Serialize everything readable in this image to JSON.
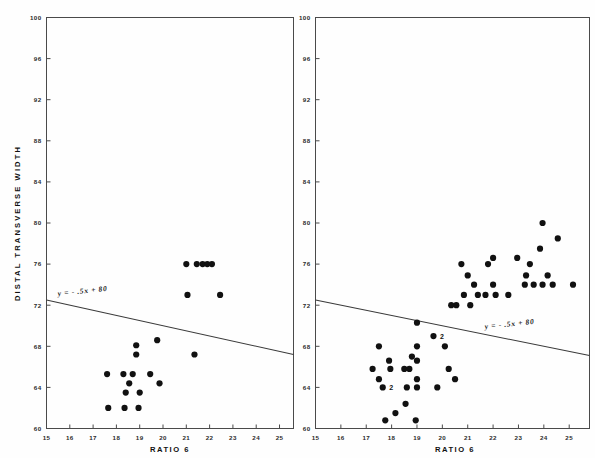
{
  "figure": {
    "type": "scatter-figure",
    "panel_count": 2
  },
  "axes": {
    "x_title": "RATIO 6",
    "y_title": "DISTAL  TRANSVERSE  WIDTH",
    "x_ticks": [
      "15",
      "16",
      "17",
      "18",
      "19",
      "20",
      "21",
      "22",
      "23",
      "24",
      "25"
    ],
    "y_ticks": [
      "60",
      "64",
      "68",
      "72",
      "76",
      "80",
      "84",
      "88",
      "92",
      "96",
      "100"
    ],
    "equation": "y = - .5x + 80"
  },
  "annotations": {
    "overplot_two": "2"
  },
  "chart_data": [
    {
      "type": "scatter",
      "title": "",
      "panel": "left",
      "xlabel": "RATIO 6",
      "ylabel": "DISTAL TRANSVERSE WIDTH",
      "xlim": [
        15,
        25.6
      ],
      "ylim": [
        60,
        100
      ],
      "xticks": [
        15,
        16,
        17,
        18,
        19,
        20,
        21,
        22,
        23,
        24,
        25
      ],
      "yticks": [
        60,
        64,
        68,
        72,
        76,
        80,
        84,
        88,
        92,
        96,
        100
      ],
      "grid": false,
      "legend": false,
      "regression_line": {
        "label": "y = - .5x + 80",
        "slope": -0.5,
        "intercept": 80,
        "x_start": 15,
        "y_start": 72.5,
        "x_end": 25.6,
        "y_end": 67.2
      },
      "points": [
        {
          "x": 17.65,
          "y": 62.0
        },
        {
          "x": 18.35,
          "y": 62.0
        },
        {
          "x": 18.95,
          "y": 62.0
        },
        {
          "x": 17.6,
          "y": 65.3
        },
        {
          "x": 18.3,
          "y": 65.3
        },
        {
          "x": 18.7,
          "y": 65.3
        },
        {
          "x": 19.45,
          "y": 65.3
        },
        {
          "x": 18.55,
          "y": 64.4
        },
        {
          "x": 19.85,
          "y": 64.4
        },
        {
          "x": 18.4,
          "y": 63.5
        },
        {
          "x": 19.0,
          "y": 63.5
        },
        {
          "x": 18.85,
          "y": 67.2
        },
        {
          "x": 18.85,
          "y": 68.1
        },
        {
          "x": 19.75,
          "y": 68.6
        },
        {
          "x": 21.35,
          "y": 67.2
        },
        {
          "x": 21.05,
          "y": 73.0
        },
        {
          "x": 22.45,
          "y": 73.0
        },
        {
          "x": 21.0,
          "y": 76.0
        },
        {
          "x": 21.45,
          "y": 76.0
        },
        {
          "x": 21.7,
          "y": 76.0
        },
        {
          "x": 21.9,
          "y": 76.0
        },
        {
          "x": 22.1,
          "y": 76.0
        }
      ]
    },
    {
      "type": "scatter",
      "title": "",
      "panel": "right",
      "xlabel": "RATIO 6",
      "ylabel": "",
      "xlim": [
        15,
        25.8
      ],
      "ylim": [
        60,
        100
      ],
      "xticks": [
        15,
        16,
        17,
        18,
        19,
        20,
        21,
        22,
        23,
        24,
        25
      ],
      "yticks": [
        60,
        64,
        68,
        72,
        76,
        80,
        84,
        88,
        92,
        96,
        100
      ],
      "grid": false,
      "legend": false,
      "regression_line": {
        "label": "y = - .5x + 80",
        "slope": -0.5,
        "intercept": 80,
        "x_start": 15,
        "y_start": 72.5,
        "x_end": 25.8,
        "y_end": 67.1
      },
      "points": [
        {
          "x": 17.75,
          "y": 60.8
        },
        {
          "x": 18.95,
          "y": 60.8
        },
        {
          "x": 18.15,
          "y": 61.5
        },
        {
          "x": 18.55,
          "y": 62.4
        },
        {
          "x": 17.65,
          "y": 64.0,
          "count": 2
        },
        {
          "x": 18.6,
          "y": 64.0
        },
        {
          "x": 19.0,
          "y": 64.0
        },
        {
          "x": 19.8,
          "y": 64.0
        },
        {
          "x": 17.5,
          "y": 64.8
        },
        {
          "x": 19.0,
          "y": 64.8
        },
        {
          "x": 17.25,
          "y": 65.8
        },
        {
          "x": 17.95,
          "y": 65.8
        },
        {
          "x": 18.5,
          "y": 65.8
        },
        {
          "x": 18.7,
          "y": 65.8
        },
        {
          "x": 20.25,
          "y": 65.8
        },
        {
          "x": 20.5,
          "y": 64.8
        },
        {
          "x": 17.9,
          "y": 66.6
        },
        {
          "x": 19.0,
          "y": 66.6
        },
        {
          "x": 18.8,
          "y": 67.0
        },
        {
          "x": 17.5,
          "y": 68.0
        },
        {
          "x": 19.0,
          "y": 68.0
        },
        {
          "x": 20.1,
          "y": 68.0
        },
        {
          "x": 19.65,
          "y": 69.0,
          "count": 2
        },
        {
          "x": 19.0,
          "y": 70.3
        },
        {
          "x": 20.35,
          "y": 72.0
        },
        {
          "x": 20.55,
          "y": 72.0
        },
        {
          "x": 21.1,
          "y": 72.0
        },
        {
          "x": 20.85,
          "y": 73.0
        },
        {
          "x": 21.4,
          "y": 73.0
        },
        {
          "x": 21.7,
          "y": 73.0
        },
        {
          "x": 22.1,
          "y": 73.0
        },
        {
          "x": 22.6,
          "y": 73.0
        },
        {
          "x": 21.25,
          "y": 74.0
        },
        {
          "x": 22.0,
          "y": 74.0
        },
        {
          "x": 23.25,
          "y": 74.0
        },
        {
          "x": 23.6,
          "y": 74.0
        },
        {
          "x": 23.95,
          "y": 74.0
        },
        {
          "x": 24.35,
          "y": 74.0
        },
        {
          "x": 25.15,
          "y": 74.0
        },
        {
          "x": 21.0,
          "y": 74.9
        },
        {
          "x": 23.3,
          "y": 74.9
        },
        {
          "x": 24.15,
          "y": 74.9
        },
        {
          "x": 20.75,
          "y": 76.0
        },
        {
          "x": 21.8,
          "y": 76.0
        },
        {
          "x": 23.45,
          "y": 76.0
        },
        {
          "x": 22.0,
          "y": 76.6
        },
        {
          "x": 22.95,
          "y": 76.6
        },
        {
          "x": 23.85,
          "y": 77.5
        },
        {
          "x": 24.55,
          "y": 78.5
        },
        {
          "x": 23.95,
          "y": 80.0
        }
      ]
    }
  ]
}
